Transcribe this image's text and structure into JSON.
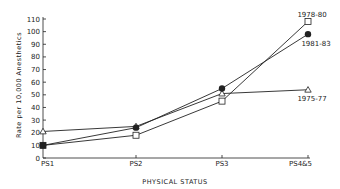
{
  "chart_data": {
    "type": "line",
    "title": "",
    "xlabel": "PHYSICAL STATUS",
    "ylabel": "Rate per 10,000 Anesthetics",
    "categories": [
      "PS1",
      "PS2",
      "PS3",
      "PS4&5"
    ],
    "ylim": [
      0,
      110
    ],
    "yticks": [
      0,
      10,
      20,
      30,
      40,
      50,
      60,
      70,
      80,
      90,
      100,
      110
    ],
    "grid": false,
    "legend": "direct labels at line ends",
    "series": [
      {
        "name": "1975-77",
        "marker": "open-triangle",
        "values": [
          21,
          25,
          51,
          54
        ]
      },
      {
        "name": "1978-80",
        "marker": "open-square",
        "values": [
          10,
          18,
          45,
          108
        ]
      },
      {
        "name": "1981-83",
        "marker": "filled-circle",
        "values": [
          10,
          24,
          55,
          98
        ]
      }
    ]
  },
  "colors": {
    "line": "#222222",
    "background": "#ffffff"
  }
}
